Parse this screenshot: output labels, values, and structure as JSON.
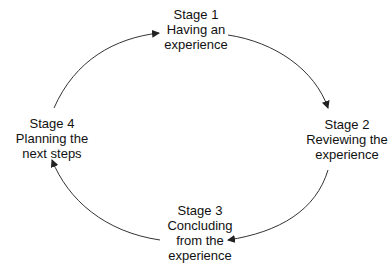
{
  "diagram": {
    "type": "cycle",
    "stroke_color": "#222222",
    "stages": [
      {
        "number": "Stage 1",
        "lines": [
          "Having an",
          "experience"
        ]
      },
      {
        "number": "Stage 2",
        "lines": [
          "Reviewing the",
          "experience"
        ]
      },
      {
        "number": "Stage 3",
        "lines": [
          "Concluding",
          "from the",
          "experience"
        ]
      },
      {
        "number": "Stage 4",
        "lines": [
          "Planning the",
          "next steps"
        ]
      }
    ],
    "arrows": [
      {
        "from": "Stage 4",
        "to": "Stage 1"
      },
      {
        "from": "Stage 1",
        "to": "Stage 2"
      },
      {
        "from": "Stage 2",
        "to": "Stage 3"
      },
      {
        "from": "Stage 3",
        "to": "Stage 4"
      }
    ]
  }
}
